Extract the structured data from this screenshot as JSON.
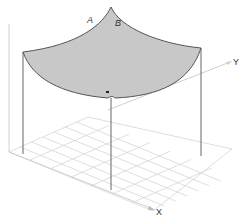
{
  "diagram": {
    "type": "3d-surface-sketch",
    "labels": {
      "point_a": "A",
      "point_b": "B",
      "axis_x": "X",
      "axis_y": "Y"
    },
    "grid": {
      "rows": 7,
      "cols": 7
    },
    "colors": {
      "surface_fill": "#c8c8c8",
      "surface_edge": "#555555",
      "grid_line": "#d6d6d6",
      "post_line": "#666666",
      "axis_line": "#cfcfcf"
    }
  }
}
